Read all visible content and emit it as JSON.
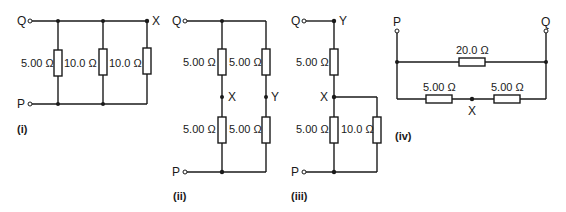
{
  "figure": {
    "circuits": [
      {
        "id": "i",
        "caption": "(i)",
        "terminals": [
          "Q",
          "P"
        ],
        "node_labels": [
          "X"
        ],
        "resistors": [
          "5.00 Ω",
          "10.0 Ω",
          "10.0 Ω"
        ]
      },
      {
        "id": "ii",
        "caption": "(ii)",
        "terminals": [
          "Q",
          "P"
        ],
        "node_labels": [
          "X",
          "Y"
        ],
        "resistors": [
          "5.00 Ω",
          "5.00 Ω",
          "5.00 Ω",
          "5.00 Ω"
        ]
      },
      {
        "id": "iii",
        "caption": "(iii)",
        "terminals": [
          "Q",
          "P"
        ],
        "node_labels": [
          "Y",
          "X"
        ],
        "resistors": [
          "5.00 Ω",
          "5.00 Ω",
          "10.0 Ω"
        ]
      },
      {
        "id": "iv",
        "caption": "(iv)",
        "terminals": [
          "P",
          "Q"
        ],
        "node_labels": [
          "X"
        ],
        "resistors": [
          "20.0 Ω",
          "5.00 Ω",
          "5.00 Ω"
        ]
      }
    ]
  }
}
